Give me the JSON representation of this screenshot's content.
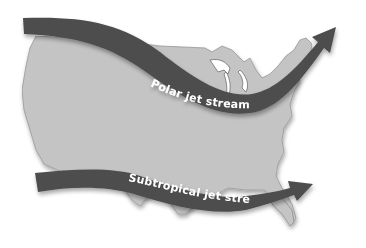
{
  "diagram": {
    "colors": {
      "background": "#ffffff",
      "map_fill": "#c4c4c4",
      "map_texture": "#b2b2b2",
      "map_outline": "#8c8c8c",
      "arrow_fill": "#4d4d4d",
      "arrow_shadow": "#2e2e2e",
      "label_color": "#ffffff"
    },
    "jet_streams": [
      {
        "id": "polar",
        "label": "Polar jet stream",
        "direction": "west-to-east, dipping south over the central US then rising northeast"
      },
      {
        "id": "subtropical",
        "label": "Subtropical jet stream",
        "direction": "west-to-east across the southern US toward the east"
      }
    ]
  }
}
